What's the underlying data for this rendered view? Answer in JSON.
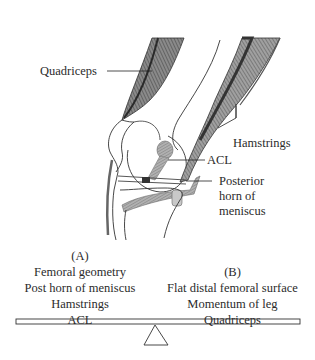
{
  "labels": {
    "quadriceps": "Quadriceps",
    "hamstrings": "Hamstrings",
    "acl": "ACL",
    "posterior_horn": [
      "Posterior",
      "horn of",
      "meniscus"
    ]
  },
  "balance": {
    "left": {
      "heading": "(A)",
      "items": [
        "Femoral geometry",
        "Post horn of meniscus",
        "Hamstrings",
        "ACL"
      ]
    },
    "right": {
      "heading": "(B)",
      "items": [
        "Flat distal femoral surface",
        "Momentum of leg",
        "Quadriceps"
      ]
    }
  }
}
